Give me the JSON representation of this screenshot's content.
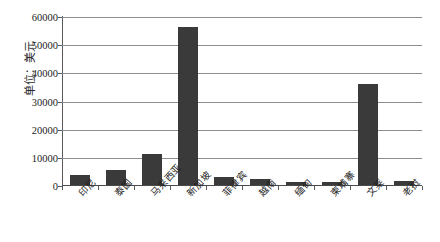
{
  "chart_data": {
    "type": "bar",
    "title": "",
    "subtitle": "",
    "xlabel": "",
    "ylabel": "单位：美元",
    "ylim": [
      0,
      60000
    ],
    "ytick_step": 10000,
    "yticks": [
      "0",
      "10000",
      "20000",
      "30000",
      "40000",
      "50000",
      "60000"
    ],
    "ytick_values": [
      0,
      10000,
      20000,
      30000,
      40000,
      50000,
      60000
    ],
    "grid": "horizontal",
    "legend": "none",
    "bar_color": "#3a3a3a",
    "categories": [
      "印尼",
      "泰国",
      "马来西亚",
      "新加坡",
      "菲律宾",
      "越南",
      "缅甸",
      "柬埔寨",
      "文莱",
      "老挝"
    ],
    "values": [
      3500,
      5500,
      11000,
      56000,
      3000,
      2000,
      1100,
      1100,
      36000,
      1500
    ],
    "series": [
      {
        "name": "人均GDP",
        "values": [
          3500,
          5500,
          11000,
          56000,
          3000,
          2000,
          1100,
          1100,
          36000,
          1500
        ]
      }
    ],
    "points": [
      {
        "category": "印尼",
        "value": 3500
      },
      {
        "category": "泰国",
        "value": 5500
      },
      {
        "category": "马来西亚",
        "value": 11000
      },
      {
        "category": "新加坡",
        "value": 56000
      },
      {
        "category": "菲律宾",
        "value": 3000
      },
      {
        "category": "越南",
        "value": 2000
      },
      {
        "category": "缅甸",
        "value": 1100
      },
      {
        "category": "柬埔寨",
        "value": 1100
      },
      {
        "category": "文莱",
        "value": 36000
      },
      {
        "category": "老挝",
        "value": 1500
      }
    ]
  }
}
